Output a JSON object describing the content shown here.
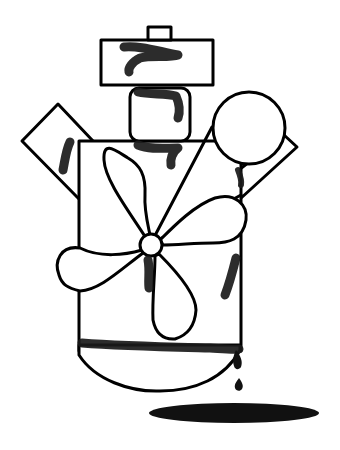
{
  "illustration": {
    "description": "Line drawing of a machine-like figure with a propeller, stacked boxes, circle, and dripping ink forming a puddle",
    "colors": {
      "background": "#ffffff",
      "stroke": "#000000",
      "ink": "#111111"
    },
    "parts": [
      {
        "name": "top-cap"
      },
      {
        "name": "head-box"
      },
      {
        "name": "neck-block"
      },
      {
        "name": "left-diamond-panel"
      },
      {
        "name": "right-slanted-bar"
      },
      {
        "name": "circle-wheel"
      },
      {
        "name": "main-body"
      },
      {
        "name": "propeller"
      },
      {
        "name": "bowl-base"
      },
      {
        "name": "ink-drips"
      },
      {
        "name": "ink-puddle"
      }
    ]
  }
}
